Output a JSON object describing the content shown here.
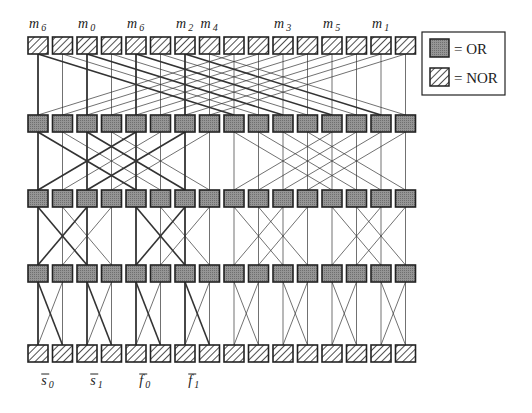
{
  "diagram": {
    "columns": 16,
    "rows": [
      "NOR",
      "OR",
      "OR",
      "OR",
      "NOR"
    ],
    "colors": {
      "or_fill": "#8c8c8c",
      "stroke": "#222222",
      "nor_fill": "#ffffff"
    },
    "top_labels": [
      {
        "col": 0,
        "base": "m",
        "sub": "6"
      },
      {
        "col": 2,
        "base": "m",
        "sub": "0"
      },
      {
        "col": 4,
        "base": "m",
        "sub": "6"
      },
      {
        "col": 6,
        "base": "m",
        "sub": "2"
      },
      {
        "col": 7,
        "base": "m",
        "sub": "4"
      },
      {
        "col": 10,
        "base": "m",
        "sub": "3"
      },
      {
        "col": 12,
        "base": "m",
        "sub": "5"
      },
      {
        "col": 14,
        "base": "m",
        "sub": "1"
      }
    ],
    "bottom_labels": [
      {
        "col": 0.5,
        "base": "s",
        "sub": "0"
      },
      {
        "col": 2.5,
        "base": "s",
        "sub": "1"
      },
      {
        "col": 4.5,
        "base": "f",
        "sub": "0"
      },
      {
        "col": 6.5,
        "base": "f",
        "sub": "1"
      }
    ],
    "stage1": {
      "type": "butterfly",
      "span": 16
    },
    "stage2": {
      "type": "butterfly",
      "span": 8
    },
    "stage3": {
      "type": "butterfly",
      "span": 4
    },
    "stage4": {
      "type": "butterfly",
      "span": 2
    }
  },
  "legend": {
    "items": [
      {
        "kind": "OR",
        "label": "= OR"
      },
      {
        "kind": "NOR",
        "label": "= NOR"
      }
    ]
  }
}
